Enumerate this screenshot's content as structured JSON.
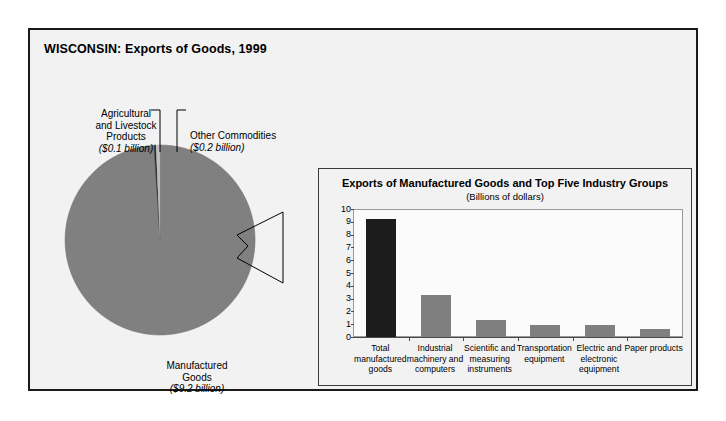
{
  "figure": {
    "title": "WISCONSIN: Exports of Goods, 1999"
  },
  "pie": {
    "labels": {
      "agricultural": {
        "line1": "Agricultural",
        "line2": "and Livestock",
        "line3": "Products",
        "value": "($0.1 billion)"
      },
      "other": {
        "line1": "Other Commodities",
        "value": "($0.2 billion)"
      },
      "manufactured": {
        "line1": "Manufactured",
        "line2": "Goods",
        "value": "($9.2 billion)"
      }
    }
  },
  "bar_panel": {
    "title": "Exports of Manufactured Goods and Top Five Industry Groups",
    "subtitle": "(Billions of dollars)"
  },
  "colors": {
    "manufactured_slice": "#808080",
    "agricultural_slice": "#262626",
    "other_slice": "#bfbfbf",
    "total_bar": "#1c1c1c",
    "industry_bar": "#7f7f7f",
    "frame": "#1a1a1a",
    "panel_background": "#f2f2f2"
  },
  "chart_data": [
    {
      "type": "pie",
      "title": "WISCONSIN: Exports of Goods, 1999",
      "unit": "billions of dollars",
      "categories": [
        "Manufactured Goods",
        "Agricultural and Livestock Products",
        "Other Commodities"
      ],
      "values": [
        9.2,
        0.1,
        0.2
      ],
      "labels": [
        "($9.2 billion)",
        "($0.1 billion)",
        "($0.2 billion)"
      ],
      "colors": [
        "#808080",
        "#262626",
        "#bfbfbf"
      ],
      "legend": "none",
      "annotations": [
        "Agricultural and Livestock Products ($0.1 billion)",
        "Other Commodities ($0.2 billion)",
        "Manufactured Goods ($9.2 billion)"
      ]
    },
    {
      "type": "bar",
      "title": "Exports of Manufactured Goods and Top Five Industry Groups",
      "subtitle": "(Billions of dollars)",
      "xlabel": "",
      "ylabel": "",
      "ylim": [
        0,
        10
      ],
      "yticks": [
        0,
        1,
        2,
        3,
        4,
        5,
        6,
        7,
        8,
        9,
        10
      ],
      "grid": false,
      "legend": "none",
      "categories": [
        "Total manufactured goods",
        "Industrial machinery and computers",
        "Scientific and measuring instruments",
        "Transportation equipment",
        "Electric and electronic equipment",
        "Paper products"
      ],
      "category_lines": [
        [
          "Total",
          "manufactured",
          "goods"
        ],
        [
          "Industrial",
          "machinery and",
          "computers"
        ],
        [
          "Scientific and",
          "measuring",
          "instruments"
        ],
        [
          "Transportation",
          "equipment"
        ],
        [
          "Electric and",
          "electronic",
          "equipment"
        ],
        [
          "Paper products"
        ]
      ],
      "values": [
        9.2,
        3.3,
        1.3,
        0.9,
        0.9,
        0.6
      ],
      "bar_colors": [
        "#1c1c1c",
        "#7f7f7f",
        "#7f7f7f",
        "#7f7f7f",
        "#7f7f7f",
        "#7f7f7f"
      ]
    }
  ]
}
